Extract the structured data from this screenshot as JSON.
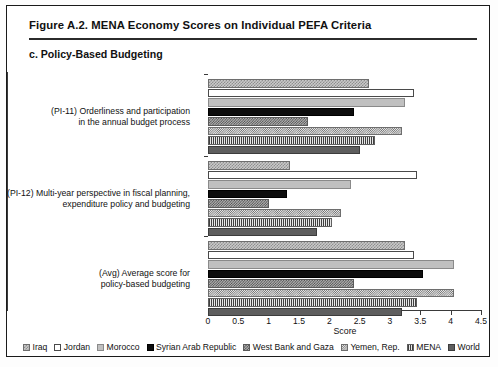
{
  "figure": {
    "title": "Figure A.2. MENA Economy Scores on Individual PEFA Criteria",
    "subtitle": "c. Policy-Based Budgeting"
  },
  "chart_data": {
    "type": "bar",
    "orientation": "horizontal",
    "title": "c. Policy-Based Budgeting",
    "xlabel": "Score",
    "ylabel": "",
    "xlim": [
      0,
      4.5
    ],
    "xticks": [
      "0",
      "0.5",
      "1",
      "1.5",
      "2",
      "2.5",
      "3",
      "3.5",
      "4",
      "4.5"
    ],
    "xtick_values": [
      0,
      0.5,
      1,
      1.5,
      2,
      2.5,
      3,
      3.5,
      4,
      4.5
    ],
    "grid": false,
    "legend_position": "bottom",
    "categories": [
      "(PI-11) Orderliness and participation in the annual budget process",
      "(PI-12) Multi-year perspective in fiscal planning, expenditure policy and budgeting",
      "(Avg) Average score for policy-based budgeting"
    ],
    "category_lines": [
      [
        "(PI-11) Orderliness and participation",
        "in the annual budget process"
      ],
      [
        "(PI-12) Multi-year perspective in fiscal planning,",
        "expenditure policy and budgeting"
      ],
      [
        "(Avg) Average score for",
        "policy-based budgeting"
      ]
    ],
    "series": [
      {
        "name": "Iraq",
        "pattern": "checkered-medium",
        "values_by_category": {
          "avg": 2.65,
          "pi12": 1.35,
          "pi11": 3.25
        }
      },
      {
        "name": "Jordan",
        "pattern": "white-outline",
        "values_by_category": {
          "avg": 3.4,
          "pi12": 3.45,
          "pi11": 3.4
        }
      },
      {
        "name": "Morocco",
        "pattern": "light-gray-solid",
        "values_by_category": {
          "avg": 3.25,
          "pi12": 2.35,
          "pi11": 4.05
        }
      },
      {
        "name": "Syrian Arab Republic",
        "pattern": "black-solid",
        "values_by_category": {
          "avg": 2.4,
          "pi12": 1.3,
          "pi11": 3.55
        }
      },
      {
        "name": "West Bank and Gaza",
        "pattern": "checkered-dark",
        "values_by_category": {
          "avg": 1.65,
          "pi12": 1.0,
          "pi11": 2.4
        }
      },
      {
        "name": "Yemen, Rep.",
        "pattern": "checkered-fine",
        "values_by_category": {
          "avg": 3.2,
          "pi12": 2.2,
          "pi11": 4.05
        }
      },
      {
        "name": "MENA",
        "pattern": "vertical-lines",
        "values_by_category": {
          "avg": 2.75,
          "pi12": 2.05,
          "pi11": 3.45
        }
      },
      {
        "name": "World",
        "pattern": "dark-gray-solid",
        "values_by_category": {
          "avg": 2.5,
          "pi12": 1.8,
          "pi11": 3.2
        }
      }
    ]
  },
  "legend": [
    {
      "label": "Iraq"
    },
    {
      "label": "Jordan"
    },
    {
      "label": "Morocco"
    },
    {
      "label": "Syrian Arab Republic"
    },
    {
      "label": "West Bank and Gaza"
    },
    {
      "label": "Yemen, Rep."
    },
    {
      "label": "MENA"
    },
    {
      "label": "World"
    }
  ]
}
